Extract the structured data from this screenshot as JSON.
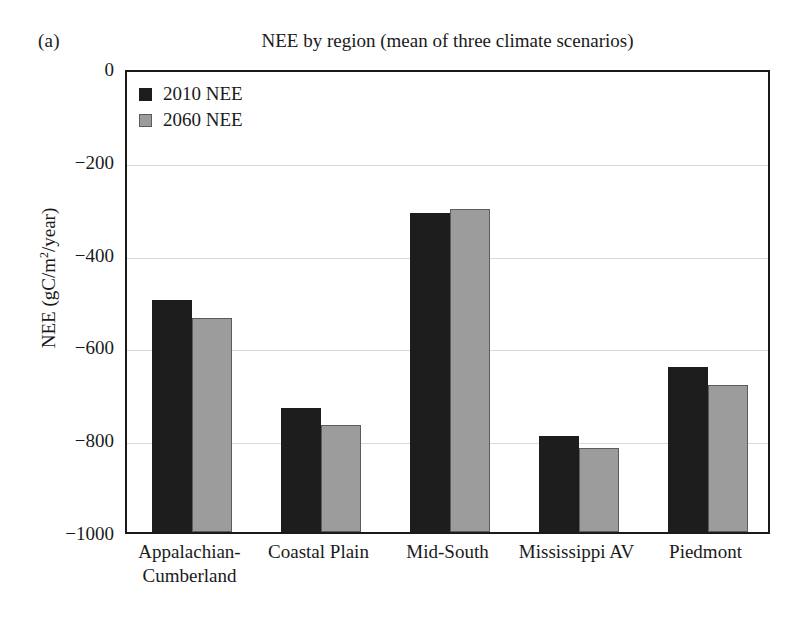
{
  "panel_label": "(a)",
  "chart_data": {
    "type": "bar",
    "title": "NEE by region (mean of three climate scenarios)",
    "xlabel": "",
    "ylabel": "NEE (gC/m2/year)",
    "ylabel_parts": {
      "pre": "NEE (gC/m",
      "sup": "2",
      "post": "/year)"
    },
    "categories": [
      "Appalachian-Cumberland",
      "Coastal Plain",
      "Mid-South",
      "Mississippi AV",
      "Piedmont"
    ],
    "category_lines": [
      [
        "Appalachian-",
        "Cumberland"
      ],
      [
        "Coastal Plain"
      ],
      [
        "Mid-South"
      ],
      [
        "Mississippi AV"
      ],
      [
        "Piedmont"
      ]
    ],
    "series": [
      {
        "name": "2010 NEE",
        "color": "#1d1d1d",
        "values": [
          -500,
          -733,
          -312,
          -792,
          -645
        ]
      },
      {
        "name": "2060 NEE",
        "color": "#9c9c9c",
        "values": [
          -538,
          -770,
          -303,
          -820,
          -683
        ]
      }
    ],
    "ylim": [
      -1000,
      0
    ],
    "y_ticks": [
      0,
      -200,
      -400,
      -600,
      -800,
      -1000
    ],
    "y_tick_labels": [
      "0",
      "−200",
      "−400",
      "−600",
      "−800",
      "−1000"
    ],
    "grid": true,
    "grid_color": "#d8d8d8",
    "legend_position": "top-left",
    "frame_color": "#1a1a1a",
    "background": "#ffffff"
  }
}
